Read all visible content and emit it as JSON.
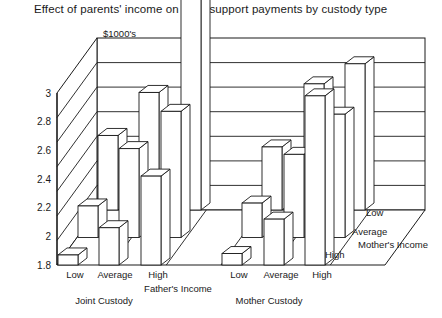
{
  "title": "Effect of parents' income on child support payments by custody type",
  "unit_label": "$1000's",
  "axes": {
    "y_ticks": [
      "1.8",
      "2",
      "2.2",
      "2.4",
      "2.6",
      "2.8",
      "3"
    ],
    "x_axis_name": "Father's Income",
    "depth_axis_name": "Mother's Income",
    "x_categories": [
      "Low",
      "Average",
      "High"
    ],
    "depth_categories": [
      "Low",
      "Average",
      "High"
    ],
    "groups": [
      "Joint Custody",
      "Mother Custody"
    ]
  },
  "chart_data": {
    "type": "bar",
    "title": "Effect of parents' income on child support payments by custody type",
    "subtitle": "$1000's",
    "xlabel": "Father's Income",
    "ylabel": "$1000's",
    "zlabel": "Mother's Income",
    "ylim": [
      1.8,
      3.4
    ],
    "yticks": [
      1.8,
      2.0,
      2.2,
      2.4,
      2.6,
      2.8,
      3.0
    ],
    "grid": true,
    "legend_position": "depth-axis-right",
    "categories": [
      "Joint Custody / Low",
      "Joint Custody / Average",
      "Joint Custody / High",
      "Mother Custody / Low",
      "Mother Custody / Average",
      "Mother Custody / High"
    ],
    "series": [
      {
        "name": "Low",
        "values": [
          2.32,
          2.62,
          3.36,
          2.24,
          2.68,
          2.82
        ]
      },
      {
        "name": "Average",
        "values": [
          2.02,
          2.42,
          2.68,
          2.04,
          2.38,
          2.66
        ]
      },
      {
        "name": "High",
        "values": [
          1.87,
          2.06,
          2.42,
          1.88,
          2.12,
          2.98
        ]
      }
    ]
  }
}
